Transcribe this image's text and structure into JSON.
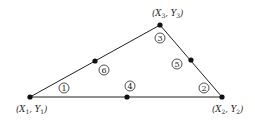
{
  "diagram": {
    "stroke_color": "#222222",
    "nodes": [
      {
        "id": "1",
        "label": "(X1, Y1)",
        "x": 30,
        "y": 97
      },
      {
        "id": "2",
        "label": "(X2, Y2)",
        "x": 222,
        "y": 97
      },
      {
        "id": "3",
        "label": "(X3, Y3)",
        "x": 160,
        "y": 25
      },
      {
        "id": "4",
        "x": 127,
        "y": 97
      },
      {
        "id": "5",
        "x": 191,
        "y": 60
      },
      {
        "id": "6",
        "x": 95,
        "y": 61
      }
    ],
    "vertex_labels": {
      "v1": {
        "x": "X",
        "s1": "1",
        "y": "Y",
        "s2": "1"
      },
      "v2": {
        "x": "X",
        "s1": "2",
        "y": "Y",
        "s2": "2"
      },
      "v3": {
        "x": "X",
        "s1": "3",
        "y": "Y",
        "s2": "3"
      }
    },
    "circled_numbers": [
      "1",
      "2",
      "3",
      "4",
      "5",
      "6"
    ]
  }
}
